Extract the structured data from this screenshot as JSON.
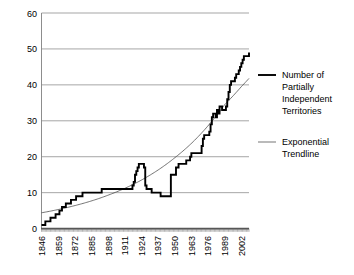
{
  "chart_data": {
    "type": "line",
    "title": "",
    "xlabel": "",
    "ylabel": "",
    "xlim": [
      1846,
      2008
    ],
    "ylim": [
      0,
      60
    ],
    "grid": true,
    "legend_position": "right",
    "y_ticks": [
      "0",
      "10",
      "20",
      "30",
      "40",
      "50",
      "60"
    ],
    "y_tick_values": [
      0,
      10,
      20,
      30,
      40,
      50,
      60
    ],
    "x_ticks": [
      "1846",
      "1859",
      "1872",
      "1885",
      "1898",
      "1911",
      "1924",
      "1937",
      "1950",
      "1963",
      "1976",
      "1989",
      "2002"
    ],
    "x_tick_values": [
      1846,
      1859,
      1872,
      1885,
      1898,
      1911,
      1924,
      1937,
      1950,
      1963,
      1976,
      1989,
      2002
    ],
    "series": [
      {
        "name": "Number of Partially Independent Territories",
        "style": "thick-step",
        "x": [
          1846,
          1847,
          1848,
          1849,
          1850,
          1851,
          1852,
          1853,
          1854,
          1855,
          1856,
          1857,
          1858,
          1859,
          1860,
          1861,
          1862,
          1863,
          1864,
          1865,
          1866,
          1867,
          1868,
          1869,
          1870,
          1871,
          1872,
          1873,
          1874,
          1875,
          1876,
          1877,
          1878,
          1879,
          1880,
          1881,
          1882,
          1883,
          1884,
          1885,
          1886,
          1887,
          1888,
          1889,
          1890,
          1891,
          1892,
          1893,
          1894,
          1895,
          1896,
          1897,
          1898,
          1899,
          1900,
          1901,
          1902,
          1903,
          1904,
          1905,
          1906,
          1907,
          1908,
          1909,
          1910,
          1911,
          1912,
          1913,
          1914,
          1915,
          1916,
          1917,
          1918,
          1919,
          1920,
          1921,
          1922,
          1923,
          1924,
          1925,
          1926,
          1927,
          1928,
          1929,
          1930,
          1931,
          1932,
          1933,
          1934,
          1935,
          1936,
          1937,
          1938,
          1939,
          1940,
          1941,
          1942,
          1943,
          1944,
          1945,
          1946,
          1947,
          1948,
          1949,
          1950,
          1951,
          1952,
          1953,
          1954,
          1955,
          1956,
          1957,
          1958,
          1959,
          1960,
          1961,
          1962,
          1963,
          1964,
          1965,
          1966,
          1967,
          1968,
          1969,
          1970,
          1971,
          1972,
          1973,
          1974,
          1975,
          1976,
          1977,
          1978,
          1979,
          1980,
          1981,
          1982,
          1983,
          1984,
          1985,
          1986,
          1987,
          1988,
          1989,
          1990,
          1991,
          1992,
          1993,
          1994,
          1995,
          1996,
          1997,
          1998,
          1999,
          2000,
          2001,
          2002,
          2003,
          2004,
          2005,
          2006,
          2007,
          2008
        ],
        "values": [
          1,
          1,
          1,
          2,
          2,
          2,
          2,
          3,
          3,
          3,
          3,
          4,
          4,
          4,
          5,
          5,
          6,
          6,
          6,
          7,
          7,
          7,
          7,
          8,
          8,
          8,
          8,
          9,
          9,
          9,
          9,
          9,
          10,
          10,
          10,
          10,
          10,
          10,
          10,
          10,
          10,
          10,
          10,
          10,
          10,
          10,
          10,
          11,
          11,
          11,
          11,
          11,
          11,
          11,
          11,
          11,
          11,
          11,
          11,
          11,
          11,
          11,
          11,
          11,
          11,
          11,
          11,
          11,
          11,
          11,
          11,
          12,
          13,
          15,
          16,
          17,
          18,
          18,
          18,
          18,
          17,
          12,
          11,
          11,
          11,
          11,
          10,
          10,
          10,
          10,
          10,
          10,
          10,
          9,
          9,
          9,
          9,
          9,
          9,
          9,
          9,
          15,
          15,
          15,
          15,
          17,
          17,
          18,
          18,
          18,
          18,
          18,
          18,
          19,
          19,
          19,
          20,
          21,
          21,
          21,
          21,
          21,
          21,
          21,
          21,
          23,
          25,
          26,
          26,
          26,
          26,
          27,
          29,
          31,
          32,
          32,
          31,
          33,
          32,
          34,
          34,
          33,
          33,
          33,
          34,
          36,
          38,
          40,
          41,
          41,
          41,
          42,
          43,
          43,
          44,
          45,
          46,
          47,
          48,
          48,
          48,
          48,
          49
        ]
      },
      {
        "name": "Exponential Trendline",
        "style": "thin-smooth",
        "x": [
          1846,
          1859,
          1872,
          1885,
          1898,
          1911,
          1924,
          1937,
          1950,
          1963,
          1976,
          1989,
          2002,
          2008
        ],
        "values": [
          4.4,
          5.3,
          6.4,
          7.7,
          9.3,
          11.2,
          13.5,
          16.3,
          19.7,
          23.7,
          28.6,
          34.5,
          39.5,
          41.8
        ]
      }
    ]
  },
  "legend": {
    "entries": [
      {
        "label_lines": [
          "Number of",
          "Partially",
          "Independent",
          "Territories"
        ],
        "swatch": "thick-line-swatch"
      },
      {
        "label_lines": [
          "Exponential",
          "Trendline"
        ],
        "swatch": "thin-line-swatch"
      }
    ]
  },
  "legend_flat": {
    "e0l0": "Number of",
    "e0l1": "Partially",
    "e0l2": "Independent",
    "e0l3": "Territories",
    "e1l0": "Exponential",
    "e1l1": "Trendline"
  },
  "y_labels": {
    "t0": "0",
    "t1": "10",
    "t2": "20",
    "t3": "30",
    "t4": "40",
    "t5": "50",
    "t6": "60"
  },
  "x_labels": {
    "t0": "1846",
    "t1": "1859",
    "t2": "1872",
    "t3": "1885",
    "t4": "1898",
    "t5": "1911",
    "t6": "1924",
    "t7": "1937",
    "t8": "1950",
    "t9": "1963",
    "t10": "1976",
    "t11": "1989",
    "t12": "2002"
  },
  "colors": {
    "series_main": "#000000",
    "trendline": "#3a3a3a",
    "gridline": "#808080",
    "axis": "#555555",
    "background": "#ffffff"
  }
}
